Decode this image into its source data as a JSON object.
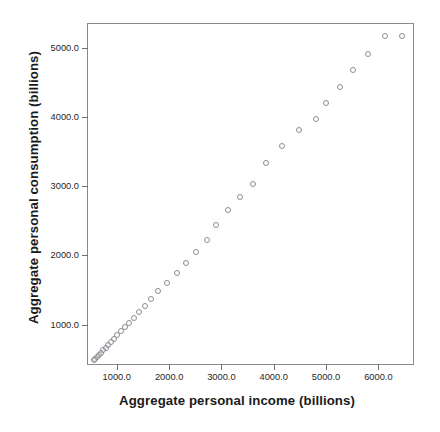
{
  "chart_data": {
    "type": "scatter",
    "title": "",
    "xlabel": "Aggregate personal income (billions)",
    "ylabel": "Aggregate personal consumption (billions)",
    "xlim": [
      450,
      6700
    ],
    "ylim": [
      400,
      5350
    ],
    "xticks": [
      1000,
      2000,
      3000,
      4000,
      5000,
      6000
    ],
    "yticks": [
      1000,
      2000,
      3000,
      4000,
      5000
    ],
    "xtick_labels": [
      "1000.0",
      "2000.0",
      "3000.0",
      "4000.0",
      "5000.0",
      "6000.0"
    ],
    "ytick_labels": [
      "1000.0",
      "2000.0",
      "3000.0",
      "4000.0",
      "5000.0"
    ],
    "grid": false,
    "legend": null,
    "marker": "open-circle",
    "marker_color": "#8d8d95",
    "frame_color": "#8a8a8a",
    "series": [
      {
        "name": "Aggregate personal consumption vs income",
        "x": [
          560,
          590,
          625,
          660,
          700,
          745,
          790,
          840,
          895,
          950,
          1010,
          1075,
          1150,
          1230,
          1320,
          1420,
          1530,
          1650,
          1790,
          1960,
          2150,
          2320,
          2510,
          2720,
          2900,
          3120,
          3350,
          3600,
          3850,
          4150,
          4480,
          4800,
          4990,
          5270,
          5520,
          5800,
          6130,
          6450
        ],
        "y": [
          480,
          505,
          530,
          560,
          595,
          630,
          665,
          705,
          750,
          795,
          845,
          900,
          960,
          1025,
          1095,
          1180,
          1270,
          1370,
          1480,
          1600,
          1750,
          1890,
          2050,
          2230,
          2440,
          2660,
          2840,
          3040,
          3340,
          3580,
          3820,
          3980,
          4210,
          4440,
          4690,
          4920,
          5170,
          5170
        ]
      }
    ]
  }
}
